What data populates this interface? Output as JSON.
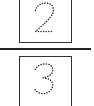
{
  "fraction": {
    "numerator": {
      "value": "2",
      "style": "dotted-trace"
    },
    "denominator": {
      "value": "3",
      "style": "dotted-trace"
    }
  },
  "colors": {
    "border": "#333333",
    "bar": "#222222",
    "dots": "#333333",
    "background": "#ffffff"
  }
}
